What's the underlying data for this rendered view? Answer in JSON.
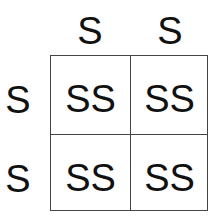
{
  "punnett": {
    "top_alleles": [
      "S",
      "S"
    ],
    "left_alleles": [
      "S",
      "S"
    ],
    "cells": [
      [
        "SS",
        "SS"
      ],
      [
        "SS",
        "SS"
      ]
    ]
  }
}
